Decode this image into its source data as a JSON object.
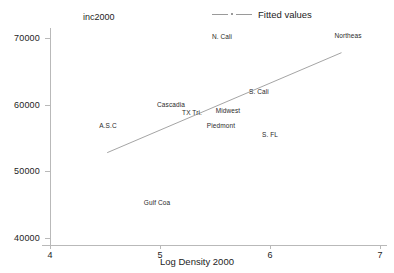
{
  "chart_data": {
    "type": "scatter",
    "title": "",
    "ylabel": "inc2000",
    "xlabel": "Log Density 2000",
    "xlim": [
      4,
      7
    ],
    "ylim": [
      40000,
      70000
    ],
    "xticks": [
      "4",
      "5",
      "6",
      "7"
    ],
    "yticks": [
      "70000",
      "60000",
      "50000",
      "40000"
    ],
    "grid": false,
    "legend": {
      "position": "top-right",
      "entries": [
        {
          "name": "fitted-values",
          "label": "Fitted values",
          "marker": "line"
        }
      ]
    },
    "points": [
      {
        "label": "N. Cali",
        "x": 5.45,
        "y": 70300
      },
      {
        "label": "Northeas",
        "x": 6.73,
        "y": 70400
      },
      {
        "label": "S. Cali",
        "x": 5.88,
        "y": 62200
      },
      {
        "label": "Cascadia",
        "x": 4.95,
        "y": 60200
      },
      {
        "label": "TX Tri.",
        "x": 5.23,
        "y": 59000
      },
      {
        "label": "Midwest",
        "x": 5.46,
        "y": 59000
      },
      {
        "label": "Piedmont",
        "x": 5.41,
        "y": 57700
      },
      {
        "label": "A.S.C",
        "x": 4.58,
        "y": 57300
      },
      {
        "label": "S. FL",
        "x": 6.02,
        "y": 56200
      },
      {
        "label": "Gulf Coa",
        "x": 4.86,
        "y": 45600
      }
    ],
    "fit_line": {
      "name": "Fitted values",
      "x_start": 4.52,
      "x_end": 6.65,
      "y_start": 52800,
      "y_end": 67800,
      "color": "#9a9a9a"
    }
  },
  "axes": {
    "y_title": "inc2000",
    "x_title": "Log Density 2000",
    "x_tick_labels": [
      "4",
      "5",
      "6",
      "7"
    ],
    "y_tick_labels": [
      "70000",
      "60000",
      "50000",
      "40000"
    ]
  },
  "legend": {
    "fitted_label": "Fitted values"
  },
  "labels": {
    "n_cali": "N. Cali",
    "northeas": "Northeas",
    "s_cali": "S. Cali",
    "cascadia": "Cascadia",
    "tx_tri": "TX Tri.",
    "midwest": "Midwest",
    "piedmont": "Piedmont",
    "asc": "A.S.C",
    "s_fl": "S. FL",
    "gulf_coa": "Gulf Coa"
  },
  "colors": {
    "axis": "#b9b9b9",
    "text": "#1d1d1d",
    "fit_line": "#9a9a9a",
    "background": "#ffffff"
  }
}
